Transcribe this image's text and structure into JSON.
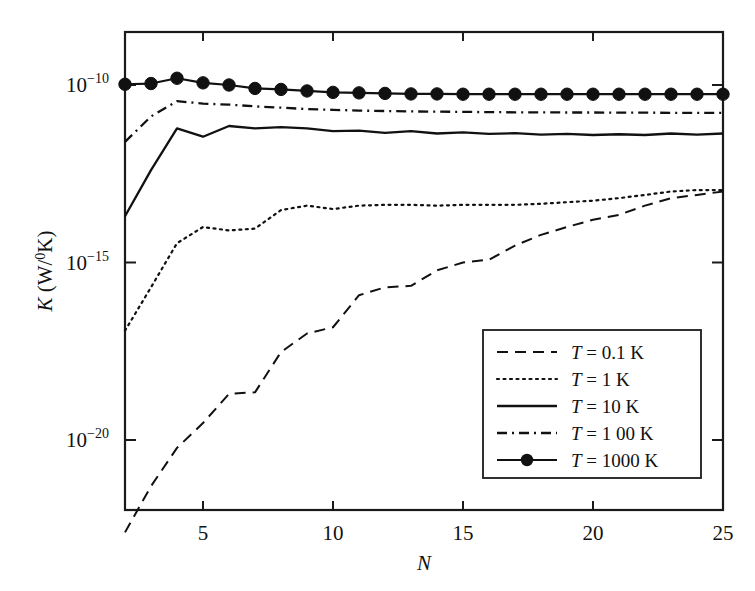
{
  "chart_data": {
    "type": "line",
    "title": "",
    "xlabel": "N",
    "ylabel": "K (W/°K)",
    "ylabel_parts": {
      "symbol": "K",
      "unit_open": " (W/",
      "unit_sup": "0",
      "unit_close": "K)"
    },
    "xlim": [
      2,
      25
    ],
    "ylim": [
      1e-23,
      1e-08
    ],
    "yscale": "log",
    "xscale": "linear",
    "grid": false,
    "legend_position": "lower right",
    "xticks": [
      5,
      10,
      15,
      20,
      25
    ],
    "xtick_labels": [
      "5",
      "10",
      "15",
      "20",
      "25"
    ],
    "yticks": [
      1e-10,
      1e-15,
      1e-20
    ],
    "ytick_labels": [
      "10−10",
      "10−15",
      "10−20"
    ],
    "ytick_mantissa": "10",
    "ytick_exponents": [
      "−10",
      "−15",
      "−20"
    ],
    "x": [
      2,
      3,
      4,
      5,
      6,
      7,
      8,
      9,
      10,
      11,
      12,
      13,
      14,
      15,
      16,
      17,
      18,
      19,
      20,
      21,
      22,
      23,
      24,
      25
    ],
    "series": [
      {
        "name": "T = 0.1 K",
        "label_symbol": "T",
        "label_rest": " = 0.1 K",
        "style": "dashed",
        "marker": "none",
        "color": "#111111",
        "linewidth": 2.0,
        "dasharray": "11,7",
        "values": [
          2.5e-23,
          5e-22,
          6e-21,
          3e-20,
          2e-19,
          2.2e-19,
          3e-18,
          1e-17,
          1.5e-17,
          1.2e-16,
          2e-16,
          2.2e-16,
          6e-16,
          1e-15,
          1.2e-15,
          3e-15,
          6e-15,
          1e-14,
          1.6e-14,
          2.2e-14,
          4e-14,
          6.5e-14,
          8e-14,
          1e-13
        ]
      },
      {
        "name": "T = 1 K",
        "label_symbol": "T",
        "label_rest": " = 1 K",
        "style": "dotted",
        "marker": "none",
        "color": "#111111",
        "linewidth": 2.2,
        "dasharray": "2,4.5",
        "values": [
          1.2e-17,
          2e-16,
          3.5e-15,
          1e-14,
          8e-15,
          9e-15,
          3e-14,
          4e-14,
          3.2e-14,
          4e-14,
          4.2e-14,
          4.2e-14,
          4e-14,
          4.2e-14,
          4.2e-14,
          4.2e-14,
          4.5e-14,
          5e-14,
          5.5e-14,
          6.5e-14,
          8e-14,
          1e-13,
          1.1e-13,
          1.1e-13
        ]
      },
      {
        "name": "T = 10 K",
        "label_symbol": "T",
        "label_rest": " = 10 K",
        "style": "solid",
        "marker": "none",
        "color": "#111111",
        "linewidth": 2.3,
        "dasharray": "",
        "values": [
          2e-14,
          4e-13,
          6e-12,
          3.5e-12,
          7e-12,
          6e-12,
          6.5e-12,
          6e-12,
          5e-12,
          5.2e-12,
          4.5e-12,
          5e-12,
          4.3e-12,
          4.6e-12,
          4.2e-12,
          4.4e-12,
          4e-12,
          4.2e-12,
          3.9e-12,
          4.1e-12,
          3.9e-12,
          4.3e-12,
          4e-12,
          4.3e-12
        ]
      },
      {
        "name": "T = 100 K",
        "label_symbol": "T",
        "label_rest": " = 1 00 K",
        "style": "dashdot",
        "marker": "none",
        "color": "#111111",
        "linewidth": 2.3,
        "dasharray": "10,5,2,5",
        "values": [
          2.5e-12,
          1.3e-11,
          3.5e-11,
          3e-11,
          2.8e-11,
          2.5e-11,
          2.3e-11,
          2.1e-11,
          2e-11,
          1.9e-11,
          1.85e-11,
          1.8e-11,
          1.78e-11,
          1.75e-11,
          1.72e-11,
          1.7e-11,
          1.7e-11,
          1.68e-11,
          1.68e-11,
          1.66e-11,
          1.66e-11,
          1.65e-11,
          1.65e-11,
          1.65e-11
        ]
      },
      {
        "name": "T = 1000 K",
        "label_symbol": "T",
        "label_rest": " = 1000 K",
        "style": "solid-marker",
        "marker": "circle",
        "color": "#111111",
        "linewidth": 2.2,
        "dasharray": "",
        "values": [
          1.05e-10,
          1.1e-10,
          1.55e-10,
          1.15e-10,
          1e-10,
          8e-11,
          7.5e-11,
          6.8e-11,
          6.2e-11,
          6e-11,
          5.8e-11,
          5.6e-11,
          5.6e-11,
          5.5e-11,
          5.5e-11,
          5.5e-11,
          5.5e-11,
          5.5e-11,
          5.5e-11,
          5.5e-11,
          5.5e-11,
          5.5e-11,
          5.5e-11,
          5.5e-11
        ]
      }
    ]
  }
}
